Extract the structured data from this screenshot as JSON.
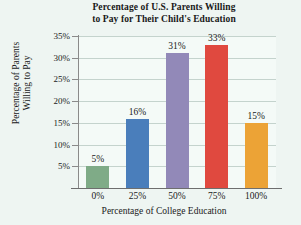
{
  "chart_data": {
    "type": "bar",
    "title": "Percentage of U.S. Parents Willing to Pay for Their Child's Education",
    "title_lines": [
      "Percentage of U.S. Parents Willing",
      "to Pay for Their Child's Education"
    ],
    "xlabel": "Percentage of College Education",
    "ylabel": "Percentage of Parents Willing to Pay",
    "ylabel_lines": [
      "Percentage of Parents",
      "Willing to Pay"
    ],
    "categories": [
      "0%",
      "25%",
      "50%",
      "75%",
      "100%"
    ],
    "values": [
      5,
      16,
      31,
      33,
      15
    ],
    "value_labels": [
      "5%",
      "16%",
      "31%",
      "33%",
      "15%"
    ],
    "ylim": [
      0,
      35
    ],
    "yticks": [
      5,
      10,
      15,
      20,
      25,
      30,
      35
    ],
    "ytick_labels": [
      "5%",
      "10%",
      "15%",
      "20%",
      "25%",
      "30%",
      "35%"
    ],
    "grid": true,
    "legend": false,
    "bar_colors": [
      "#7fab87",
      "#4a7ebb",
      "#9289b8",
      "#e0493f",
      "#eca336"
    ],
    "background_color": "#eef5f2",
    "plot_background_color": "#f4faf7",
    "gridline_color": "#c4d3cd",
    "axis_color": "#8a8a8a",
    "series": [
      {
        "name": "Percentage of parents willing to pay",
        "points": [
          {
            "category": "0%",
            "value": 5,
            "label": "5%",
            "color": "#7fab87"
          },
          {
            "category": "25%",
            "value": 16,
            "label": "16%",
            "color": "#4a7ebb"
          },
          {
            "category": "50%",
            "value": 31,
            "label": "31%",
            "color": "#9289b8"
          },
          {
            "category": "75%",
            "value": 33,
            "label": "33%",
            "color": "#e0493f"
          },
          {
            "category": "100%",
            "value": 15,
            "label": "15%",
            "color": "#eca336"
          }
        ]
      }
    ]
  }
}
